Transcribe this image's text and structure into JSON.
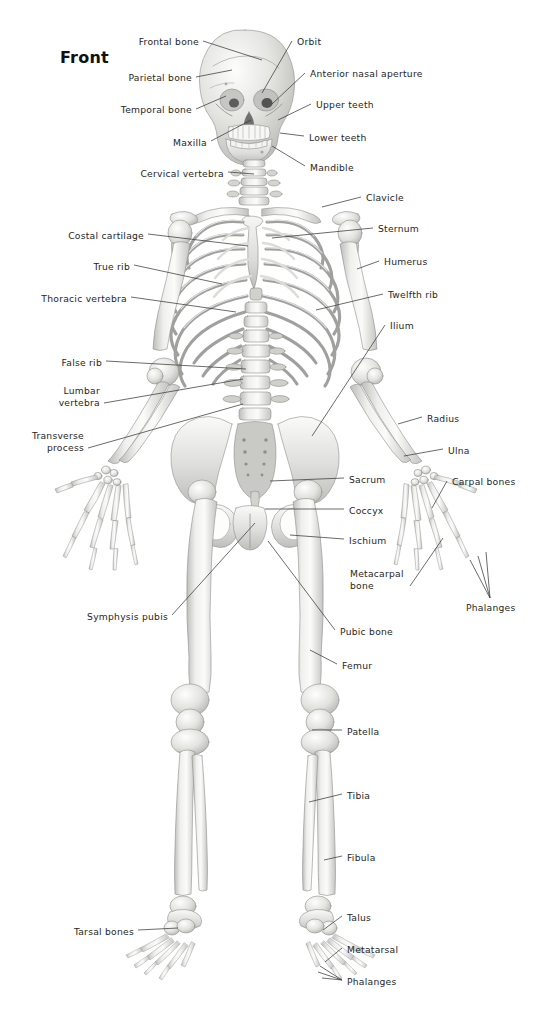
{
  "figure": {
    "title": "Front",
    "view": "anterior",
    "line_color": "#3a3a3a",
    "label_color": "#262626",
    "background": "#ffffff",
    "bone_fill_light": "#f2f2f0",
    "bone_fill_mid": "#d8d8d6",
    "bone_fill_shadow": "#b4b4b2",
    "bone_stroke": "#8c8c8a"
  },
  "labels_left": [
    {
      "id": "frontal-bone",
      "text": "Frontal bone",
      "x": 140,
      "y": 36,
      "lx": 203,
      "ly": 41,
      "tx": 262,
      "ty": 60
    },
    {
      "id": "parietal-bone",
      "text": "Parietal bone",
      "x": 130,
      "y": 72,
      "lx": 196,
      "ly": 77,
      "tx": 232,
      "ty": 70
    },
    {
      "id": "temporal-bone",
      "text": "Temporal bone",
      "x": 126,
      "y": 104,
      "lx": 196,
      "ly": 109,
      "tx": 226,
      "ty": 96
    },
    {
      "id": "maxilla",
      "text": "Maxilla",
      "x": 170,
      "y": 137,
      "lx": 211,
      "ly": 141,
      "tx": 251,
      "ty": 120
    },
    {
      "id": "cervical-vertebra",
      "text": "Cervical vertebra",
      "x": 146,
      "y": 168,
      "lx": 228,
      "ly": 172,
      "tx": 254,
      "ty": 174
    },
    {
      "id": "costal-cartilage",
      "text": "Costal cartilage",
      "x": 69,
      "y": 230,
      "lx": 148,
      "ly": 234,
      "tx": 248,
      "ty": 246
    },
    {
      "id": "true-rib",
      "text": "True rib",
      "x": 92,
      "y": 261,
      "lx": 134,
      "ly": 265,
      "tx": 222,
      "ty": 284
    },
    {
      "id": "thoracic-vertebra",
      "text": "Thoracic vertebra",
      "x": 50,
      "y": 293,
      "lx": 131,
      "ly": 297,
      "tx": 236,
      "ty": 312
    },
    {
      "id": "false-rib",
      "text": "False rib",
      "x": 61,
      "y": 357,
      "lx": 106,
      "ly": 361,
      "tx": 246,
      "ty": 369
    },
    {
      "id": "lumbar-vertebra",
      "text": "Lumbar\nvertebra",
      "x": 58,
      "y": 385,
      "lx": 104,
      "ly": 403,
      "tx": 243,
      "ty": 379
    },
    {
      "id": "transverse-process",
      "text": "Transverse\nprocess",
      "x": 27,
      "y": 430,
      "lx": 88,
      "ly": 448,
      "tx": 243,
      "ty": 404
    },
    {
      "id": "symphysis-pubis",
      "text": "Symphysis pubis",
      "x": 88,
      "y": 611,
      "lx": 172,
      "ly": 615,
      "tx": 255,
      "ty": 523
    },
    {
      "id": "tarsal-bones",
      "text": "Tarsal bones",
      "x": 78,
      "y": 926,
      "lx": 138,
      "ly": 930,
      "tx": 178,
      "ty": 928
    }
  ],
  "labels_right": [
    {
      "id": "orbit",
      "text": "Orbit",
      "x": 297,
      "y": 36,
      "lx": 292,
      "ly": 41,
      "tx": 262,
      "ty": 93
    },
    {
      "id": "anterior-nasal-aperture",
      "text": "Anterior nasal aperture",
      "x": 310,
      "y": 68,
      "lx": 305,
      "ly": 73,
      "tx": 272,
      "ty": 104
    },
    {
      "id": "upper-teeth",
      "text": "Upper teeth",
      "x": 316,
      "y": 99,
      "lx": 311,
      "ly": 104,
      "tx": 278,
      "ty": 120
    },
    {
      "id": "lower-teeth",
      "text": "Lower teeth",
      "x": 309,
      "y": 132,
      "lx": 304,
      "ly": 136,
      "tx": 280,
      "ty": 133
    },
    {
      "id": "mandible",
      "text": "Mandible",
      "x": 310,
      "y": 162,
      "lx": 305,
      "ly": 166,
      "tx": 272,
      "ty": 146
    },
    {
      "id": "clavicle",
      "text": "Clavicle",
      "x": 366,
      "y": 192,
      "lx": 361,
      "ly": 197,
      "tx": 322,
      "ty": 207
    },
    {
      "id": "sternum",
      "text": "Sternum",
      "x": 378,
      "y": 223,
      "lx": 373,
      "ly": 228,
      "tx": 272,
      "ty": 238
    },
    {
      "id": "humerus",
      "text": "Humerus",
      "x": 384,
      "y": 256,
      "lx": 379,
      "ly": 261,
      "tx": 357,
      "ty": 269
    },
    {
      "id": "twelfth-rib",
      "text": "Twelfth rib",
      "x": 388,
      "y": 289,
      "lx": 383,
      "ly": 294,
      "tx": 316,
      "ty": 310
    },
    {
      "id": "ilium",
      "text": "Ilium",
      "x": 390,
      "y": 320,
      "lx": 385,
      "ly": 325,
      "tx": 312,
      "ty": 436
    },
    {
      "id": "radius",
      "text": "Radius",
      "x": 427,
      "y": 413,
      "lx": 422,
      "ly": 417,
      "tx": 398,
      "ty": 424
    },
    {
      "id": "ulna",
      "text": "Ulna",
      "x": 448,
      "y": 445,
      "lx": 443,
      "ly": 449,
      "tx": 404,
      "ty": 456
    },
    {
      "id": "sacrum",
      "text": "Sacrum",
      "x": 349,
      "y": 474,
      "lx": 344,
      "ly": 478,
      "tx": 270,
      "ty": 481
    },
    {
      "id": "carpal-bones",
      "text": "Carpal bones",
      "x": 452,
      "y": 476,
      "lx": 447,
      "ly": 481,
      "tx": 432,
      "ty": 508
    },
    {
      "id": "coccyx",
      "text": "Coccyx",
      "x": 349,
      "y": 505,
      "lx": 344,
      "ly": 509,
      "tx": 265,
      "ty": 509
    },
    {
      "id": "ischium",
      "text": "Ischium",
      "x": 349,
      "y": 535,
      "lx": 344,
      "ly": 539,
      "tx": 290,
      "ty": 535
    },
    {
      "id": "metacarpal-bone",
      "text": "Metacarpal\nbone",
      "x": 350,
      "y": 568,
      "lx": 410,
      "ly": 586,
      "tx": 443,
      "ty": 538
    },
    {
      "id": "phalanges-hand",
      "text": "Phalanges",
      "x": 466,
      "y": 602,
      "lx": 490,
      "ly": 598,
      "tx": 478,
      "ty": 556
    },
    {
      "id": "pubic-bone",
      "text": "Pubic bone",
      "x": 340,
      "y": 626,
      "lx": 335,
      "ly": 630,
      "tx": 268,
      "ty": 541
    },
    {
      "id": "femur",
      "text": "Femur",
      "x": 342,
      "y": 660,
      "lx": 337,
      "ly": 664,
      "tx": 310,
      "ty": 650
    },
    {
      "id": "patella",
      "text": "Patella",
      "x": 347,
      "y": 726,
      "lx": 342,
      "ly": 730,
      "tx": 312,
      "ty": 730
    },
    {
      "id": "tibia",
      "text": "Tibia",
      "x": 347,
      "y": 790,
      "lx": 342,
      "ly": 794,
      "tx": 309,
      "ty": 802
    },
    {
      "id": "fibula",
      "text": "Fibula",
      "x": 347,
      "y": 852,
      "lx": 342,
      "ly": 856,
      "tx": 324,
      "ty": 860
    },
    {
      "id": "talus",
      "text": "Talus",
      "x": 347,
      "y": 912,
      "lx": 342,
      "ly": 916,
      "tx": 323,
      "ty": 930
    },
    {
      "id": "metatarsal",
      "text": "Metatarsal",
      "x": 347,
      "y": 944,
      "lx": 342,
      "ly": 948,
      "tx": 325,
      "ty": 962
    },
    {
      "id": "phalanges-foot",
      "text": "Phalanges",
      "x": 347,
      "y": 976,
      "lx": 342,
      "ly": 980,
      "tx": 318,
      "ty": 972
    }
  ]
}
